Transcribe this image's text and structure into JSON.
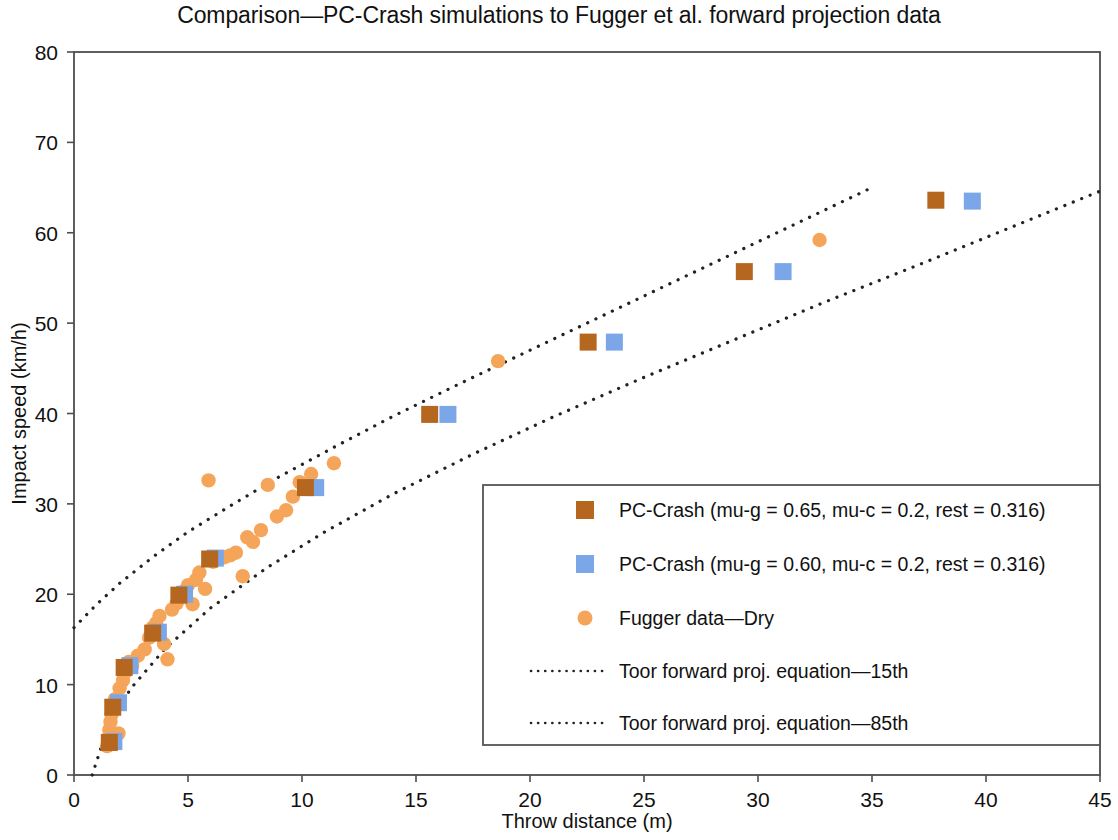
{
  "chart_data": {
    "type": "scatter",
    "title": "Comparison—PC-Crash simulations to Fugger et al. forward projection data",
    "xlabel": "Throw distance (m)",
    "ylabel": "Impact speed (km/h)",
    "xlim": [
      0,
      45
    ],
    "ylim": [
      0,
      80
    ],
    "xticks": [
      0,
      5,
      10,
      15,
      20,
      25,
      30,
      35,
      40,
      45
    ],
    "yticks": [
      0,
      10,
      20,
      30,
      40,
      50,
      60,
      70,
      80
    ],
    "grid": false,
    "legend_position": "center-right-inside",
    "colors": {
      "pccrash_065": "#b5671f",
      "pccrash_060": "#7ba7e8",
      "fugger_dry": "#f5a55a",
      "toor_curves": "#222222",
      "axis": "#4d4d4d"
    },
    "series": [
      {
        "name": "PC-Crash (mu-g = 0.65, mu-c = 0.2, rest = 0.316)",
        "marker": "square",
        "color": "#b5671f",
        "points": [
          [
            1.55,
            3.6
          ],
          [
            1.7,
            7.5
          ],
          [
            2.2,
            11.9
          ],
          [
            3.45,
            15.7
          ],
          [
            4.6,
            19.9
          ],
          [
            5.95,
            23.9
          ],
          [
            10.15,
            31.8
          ],
          [
            15.6,
            39.9
          ],
          [
            22.55,
            47.9
          ],
          [
            29.4,
            55.7
          ],
          [
            37.8,
            63.6
          ]
        ]
      },
      {
        "name": "PC-Crash (mu-g = 0.60, mu-c = 0.2, rest = 0.316)",
        "marker": "square",
        "color": "#7ba7e8",
        "points": [
          [
            1.75,
            3.7
          ],
          [
            1.95,
            8.0
          ],
          [
            2.45,
            12.1
          ],
          [
            3.7,
            15.8
          ],
          [
            4.85,
            20.0
          ],
          [
            6.2,
            24.0
          ],
          [
            10.6,
            31.8
          ],
          [
            16.4,
            39.9
          ],
          [
            23.7,
            47.9
          ],
          [
            31.1,
            55.7
          ],
          [
            39.4,
            63.5
          ]
        ]
      },
      {
        "name": "Fugger data—Dry",
        "marker": "circle",
        "color": "#f5a55a",
        "points": [
          [
            1.45,
            3.2
          ],
          [
            1.5,
            4.1
          ],
          [
            1.55,
            5.0
          ],
          [
            1.6,
            5.9
          ],
          [
            1.65,
            6.7
          ],
          [
            1.75,
            7.6
          ],
          [
            1.8,
            8.4
          ],
          [
            1.95,
            4.6
          ],
          [
            2.0,
            9.6
          ],
          [
            2.15,
            10.5
          ],
          [
            2.25,
            11.4
          ],
          [
            2.4,
            12.5
          ],
          [
            2.55,
            12.1
          ],
          [
            2.8,
            13.2
          ],
          [
            3.1,
            13.9
          ],
          [
            3.3,
            15.2
          ],
          [
            3.45,
            16.3
          ],
          [
            3.6,
            16.8
          ],
          [
            3.75,
            17.6
          ],
          [
            3.95,
            14.5
          ],
          [
            4.1,
            12.8
          ],
          [
            4.3,
            18.3
          ],
          [
            4.5,
            19.0
          ],
          [
            4.65,
            19.6
          ],
          [
            4.8,
            20.3
          ],
          [
            5.0,
            21.0
          ],
          [
            5.2,
            18.9
          ],
          [
            5.35,
            21.6
          ],
          [
            5.5,
            22.4
          ],
          [
            5.75,
            20.6
          ],
          [
            5.9,
            32.6
          ],
          [
            6.1,
            23.6
          ],
          [
            6.35,
            23.9
          ],
          [
            6.6,
            24.1
          ],
          [
            6.85,
            24.3
          ],
          [
            7.1,
            24.6
          ],
          [
            7.4,
            22.0
          ],
          [
            7.6,
            26.3
          ],
          [
            7.85,
            25.8
          ],
          [
            8.2,
            27.1
          ],
          [
            8.5,
            32.1
          ],
          [
            8.9,
            28.6
          ],
          [
            9.3,
            29.3
          ],
          [
            9.6,
            30.8
          ],
          [
            9.9,
            32.4
          ],
          [
            10.4,
            33.3
          ],
          [
            11.4,
            34.5
          ],
          [
            18.6,
            45.8
          ],
          [
            32.7,
            59.2
          ]
        ]
      }
    ],
    "curves": [
      {
        "name": "Toor forward proj. equation—15th",
        "style": "dotted",
        "points": [
          [
            0.0,
            16.3
          ],
          [
            1.0,
            18.9
          ],
          [
            2.0,
            21.2
          ],
          [
            3.5,
            24.2
          ],
          [
            5.0,
            26.9
          ],
          [
            7.0,
            30.0
          ],
          [
            9.0,
            33.0
          ],
          [
            11.5,
            36.4
          ],
          [
            14.0,
            39.7
          ],
          [
            17.0,
            43.4
          ],
          [
            20.0,
            47.0
          ],
          [
            23.0,
            50.6
          ],
          [
            26.0,
            54.2
          ],
          [
            29.0,
            57.8
          ],
          [
            32.0,
            61.4
          ],
          [
            35.0,
            65.0
          ]
        ]
      },
      {
        "name": "Toor forward proj. equation—85th",
        "style": "dotted",
        "points": [
          [
            0.8,
            0.0
          ],
          [
            1.5,
            5.5
          ],
          [
            2.5,
            9.6
          ],
          [
            4.0,
            14.0
          ],
          [
            6.0,
            18.5
          ],
          [
            8.5,
            23.0
          ],
          [
            11.0,
            26.9
          ],
          [
            14.0,
            31.1
          ],
          [
            17.5,
            35.5
          ],
          [
            21.0,
            39.6
          ],
          [
            25.0,
            44.0
          ],
          [
            29.0,
            48.2
          ],
          [
            33.0,
            52.4
          ],
          [
            37.0,
            56.4
          ],
          [
            41.0,
            60.5
          ],
          [
            45.0,
            64.6
          ]
        ]
      }
    ]
  },
  "legend": {
    "items": [
      {
        "label": "PC-Crash (mu-g = 0.65, mu-c = 0.2, rest = 0.316)",
        "marker": "square",
        "color": "#b5671f"
      },
      {
        "label": "PC-Crash (mu-g = 0.60, mu-c = 0.2, rest = 0.316)",
        "marker": "square",
        "color": "#7ba7e8"
      },
      {
        "label": "Fugger data—Dry",
        "marker": "circle",
        "color": "#f5a55a"
      },
      {
        "label": "Toor forward proj. equation—15th",
        "marker": "dotted-line",
        "color": "#222222"
      },
      {
        "label": "Toor forward proj. equation—85th",
        "marker": "dotted-line",
        "color": "#222222"
      }
    ]
  }
}
